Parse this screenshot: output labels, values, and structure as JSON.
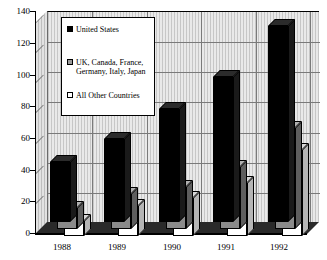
{
  "chart_data": {
    "type": "bar",
    "title": "",
    "subtitle": "",
    "xlabel": "",
    "ylabel": "",
    "categories": [
      "1988",
      "1989",
      "1990",
      "1991",
      "1992"
    ],
    "ylim": [
      0,
      140
    ],
    "yticks": [
      0,
      20,
      40,
      60,
      80,
      100,
      120,
      140
    ],
    "ytick_labels": [
      "0",
      "20",
      "40",
      "60",
      "80",
      "100",
      "120",
      "140"
    ],
    "grid": true,
    "legend_position": "upper-left-inside",
    "style": "3d-grouped-bars",
    "series": [
      {
        "name": "All Other Countries",
        "color": "#ffffff",
        "swatch": "sw-white",
        "values": [
          10,
          20,
          25,
          35,
          57
        ]
      },
      {
        "name": "UK, Canada, France, Germany, Italy, Japan",
        "color": "#8a8a8a",
        "swatch": "sw-gray",
        "values": [
          14,
          23,
          28,
          41,
          67
        ]
      },
      {
        "name": "United States",
        "color": "#000000",
        "swatch": "sw-black",
        "values": [
          40,
          55,
          75,
          96,
          130
        ]
      }
    ]
  },
  "legend": {
    "entries": [
      {
        "label": "United States",
        "swatch": "sw-black"
      },
      {
        "label": "UK, Canada, France,\nGermany, Italy, Japan",
        "swatch": "sw-gray"
      },
      {
        "label": "All Other Countries",
        "swatch": "sw-white"
      }
    ]
  },
  "axis": {
    "y_ticks": [
      "140",
      "120",
      "100",
      "80",
      "60",
      "40",
      "20",
      "0"
    ],
    "x_ticks": [
      "1988",
      "1989",
      "1990",
      "1991",
      "1992"
    ]
  }
}
